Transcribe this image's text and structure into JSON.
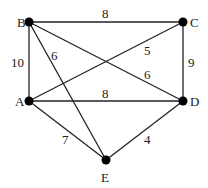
{
  "diagram": {
    "type": "weighted-undirected-graph",
    "nodes": [
      {
        "id": "B",
        "label": "B",
        "x": 29,
        "y": 22,
        "lx": 17,
        "ly": 27
      },
      {
        "id": "C",
        "label": "C",
        "x": 183,
        "y": 22,
        "lx": 190,
        "ly": 27
      },
      {
        "id": "A",
        "label": "A",
        "x": 29,
        "y": 101,
        "lx": 15,
        "ly": 106
      },
      {
        "id": "D",
        "label": "D",
        "x": 183,
        "y": 101,
        "lx": 190,
        "ly": 106
      },
      {
        "id": "E",
        "label": "E",
        "x": 106,
        "y": 160,
        "lx": 101,
        "ly": 182
      }
    ],
    "edges": [
      {
        "from": "B",
        "to": "C",
        "weight": "8",
        "lx": 102,
        "ly": 18
      },
      {
        "from": "B",
        "to": "A",
        "weight": "10",
        "lx": 11,
        "ly": 67
      },
      {
        "from": "B",
        "to": "E",
        "weight": "6",
        "lx": 51,
        "ly": 60
      },
      {
        "from": "C",
        "to": "A",
        "weight": "5",
        "lx": 144,
        "ly": 55
      },
      {
        "from": "B",
        "to": "D",
        "weight": "6",
        "lx": 144,
        "ly": 79
      },
      {
        "from": "C",
        "to": "D",
        "weight": "9",
        "lx": 188,
        "ly": 67
      },
      {
        "from": "A",
        "to": "D",
        "weight": "8",
        "lx": 102,
        "ly": 98
      },
      {
        "from": "A",
        "to": "E",
        "weight": "7",
        "lx": 62,
        "ly": 144
      },
      {
        "from": "D",
        "to": "E",
        "weight": "4",
        "lx": 144,
        "ly": 144
      }
    ]
  }
}
